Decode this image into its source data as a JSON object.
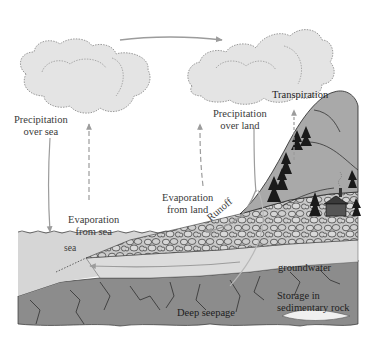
{
  "diagram": {
    "type": "water-cycle",
    "colors": {
      "cloud_fill": "#e4e4e4",
      "cloud_edge": "#9a9a9a",
      "arrow": "#9c9c9c",
      "sea": "#d6d6d6",
      "mountain": "#a9a9a9",
      "gravel": "#c8c8c8",
      "groundwater": "#dcdcdc",
      "bedrock": "#8c8c8c",
      "tree": "#1a1a1a"
    },
    "labels": {
      "precip_sea_1": "Precipitation",
      "precip_sea_2": "over sea",
      "precip_land_1": "Precipitation",
      "precip_land_2": "over land",
      "transpiration": "Transpiration",
      "evap_sea_1": "Evaporation",
      "evap_sea_2": "from sea",
      "evap_land_1": "Evaporation",
      "evap_land_2": "from land",
      "runoff": "Runoff",
      "sea": "sea",
      "groundwater": "groundwater",
      "storage_1": "Storage in",
      "storage_2": "sedimentary rock",
      "deep_seepage": "Deep seepage"
    }
  }
}
